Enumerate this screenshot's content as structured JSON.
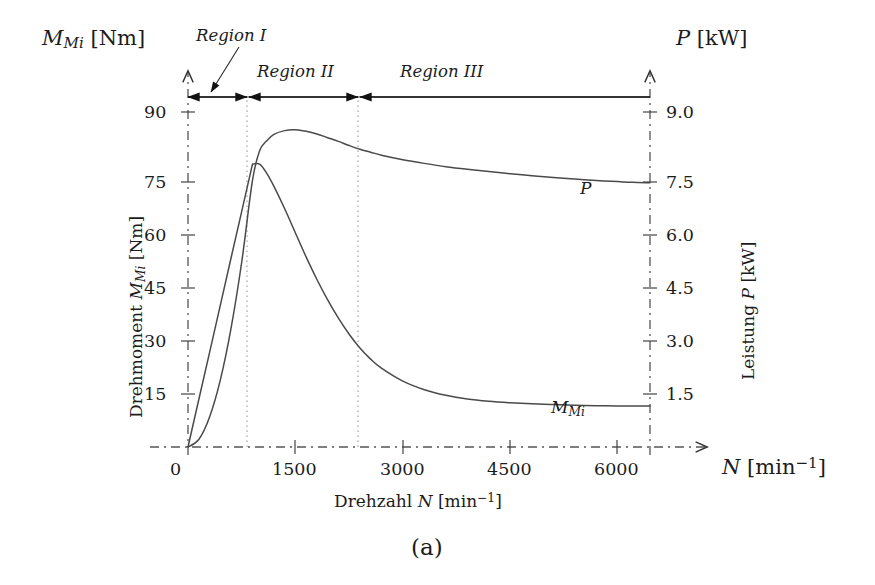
{
  "figure": {
    "caption": "(a)"
  },
  "axes": {
    "left_axis_title_main": "M",
    "left_axis_title_sub": "Mi",
    "left_axis_title_unit": "[Nm]",
    "right_axis_title_main": "P",
    "right_axis_title_unit": "[kW]",
    "x_axis_title_main": "N",
    "x_axis_title_unit_base": "[min",
    "x_axis_title_unit_exp": "−1",
    "x_axis_title_unit_close": "]",
    "x_axis_name_prefix": "Drehzahl",
    "x_axis_name_var": "N",
    "x_axis_name_unit_base": "[min",
    "x_axis_name_unit_exp": "−1",
    "x_axis_name_unit_close": "]",
    "left_axis_name_prefix": "Drehmoment",
    "left_axis_name_var_main": "M",
    "left_axis_name_var_sub": "Mi",
    "left_axis_name_unit": "[Nm]",
    "right_axis_name_prefix": "Leistung",
    "right_axis_name_var": "P",
    "right_axis_name_unit": "[kW]"
  },
  "regions": [
    {
      "label": "Region I",
      "start_rpm": 0,
      "end_rpm": 900
    },
    {
      "label": "Region II",
      "start_rpm": 900,
      "end_rpm": 2400
    },
    {
      "label": "Region III",
      "start_rpm": 2400,
      "end_rpm": 6450
    }
  ],
  "curve_labels": {
    "power_main": "P",
    "torque_main": "M",
    "torque_sub": "Mi"
  },
  "chart_data": {
    "type": "line",
    "title": "",
    "xlabel": "Drehzahl N [min^-1]",
    "ylabel": "Drehmoment M_Mi [Nm]",
    "y2label": "Leistung P [kW]",
    "xlim": [
      0,
      6450
    ],
    "ylim": [
      0,
      95
    ],
    "y2lim": [
      0,
      9.5
    ],
    "grid": false,
    "legend_position": "inline-curve-labels",
    "xticks": [
      0,
      1500,
      3000,
      4500,
      6000
    ],
    "xticklabels": [
      "0",
      "1500",
      "3000",
      "4500",
      "6000"
    ],
    "yticks": [
      15,
      30,
      45,
      60,
      75,
      90
    ],
    "yticklabels": [
      "15",
      "30",
      "45",
      "60",
      "75",
      "90"
    ],
    "y2ticks": [
      1.5,
      3.0,
      4.5,
      6.0,
      7.5,
      9.0
    ],
    "y2ticklabels": [
      "1.5",
      "3.0",
      "4.5",
      "6.0",
      "7.5",
      "9.0"
    ],
    "region_boundaries_rpm": [
      900,
      2400
    ],
    "series": [
      {
        "name": "M_Mi",
        "axis": "left",
        "unit": "Nm",
        "x": [
          0,
          150,
          300,
          450,
          600,
          750,
          900,
          1000,
          1100,
          1200,
          1350,
          1500,
          1650,
          1800,
          1950,
          2100,
          2250,
          2400,
          2550,
          2700,
          3000,
          3300,
          3600,
          3900,
          4200,
          4500,
          4800,
          5100,
          5400,
          5700,
          6000,
          6200,
          6450
        ],
        "values": [
          0,
          12.7,
          25.3,
          38.0,
          50.7,
          63.3,
          76.0,
          76.0,
          73.5,
          70.0,
          64.0,
          57.5,
          51.0,
          45.0,
          39.5,
          34.6,
          30.3,
          26.6,
          23.6,
          21.2,
          17.7,
          15.4,
          13.9,
          12.9,
          12.3,
          11.9,
          11.6,
          11.4,
          11.2,
          11.1,
          11.0,
          11.0,
          11.0
        ]
      },
      {
        "name": "P",
        "axis": "right",
        "unit": "kW",
        "x": [
          0,
          150,
          300,
          450,
          600,
          750,
          900,
          1000,
          1100,
          1200,
          1350,
          1500,
          1650,
          1800,
          1950,
          2100,
          2250,
          2400,
          2550,
          2700,
          3000,
          3300,
          3600,
          3900,
          4200,
          4500,
          4800,
          5100,
          5400,
          5700,
          6000,
          6200,
          6450
        ],
        "values": [
          0,
          0.2,
          0.8,
          1.79,
          3.18,
          4.97,
          7.16,
          7.96,
          8.23,
          8.4,
          8.5,
          8.52,
          8.48,
          8.41,
          8.31,
          8.21,
          8.1,
          8.0,
          7.92,
          7.84,
          7.72,
          7.62,
          7.53,
          7.46,
          7.4,
          7.34,
          7.29,
          7.24,
          7.2,
          7.16,
          7.13,
          7.11,
          7.1
        ]
      }
    ]
  }
}
